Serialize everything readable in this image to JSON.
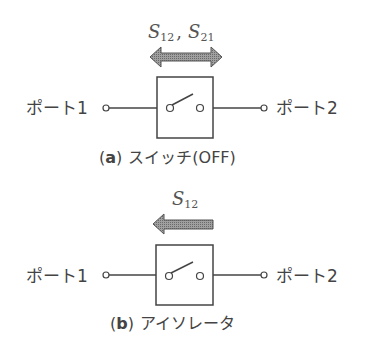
{
  "diagram_a": {
    "param_label": "S12, S21",
    "param_main_1": "S",
    "param_sub_1": "12",
    "param_sep": ",",
    "param_main_2": "S",
    "param_sub_2": "21",
    "arrow_direction": "bidirectional",
    "port1_label": "ポート1",
    "port2_label": "ポート2",
    "caption_letter": "a",
    "caption_open": "(",
    "caption_close": ")",
    "caption_text": "スイッチ(OFF)"
  },
  "diagram_b": {
    "param_label": "S12",
    "param_main_1": "S",
    "param_sub_1": "12",
    "arrow_direction": "left",
    "port1_label": "ポート1",
    "port2_label": "ポート2",
    "caption_letter": "b",
    "caption_open": "(",
    "caption_close": ")",
    "caption_text": "アイソレータ"
  },
  "colors": {
    "line": "#444444",
    "arrow_fill": "#8a8a8a",
    "arrow_stroke": "#555555",
    "text": "#444444"
  }
}
